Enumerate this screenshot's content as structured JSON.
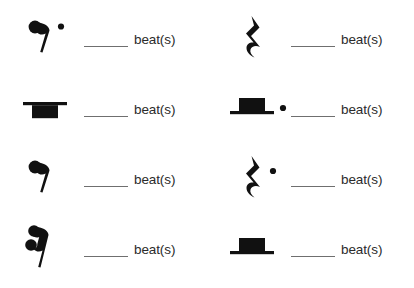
{
  "page": {
    "background_color": "#ffffff",
    "ink_color": "#111111",
    "line_color": "#6f6f6f",
    "text_color": "#2b2b2b",
    "columns": 2,
    "rows": 4
  },
  "labels": {
    "beats": "beat(s)",
    "blank": ""
  },
  "items": [
    {
      "position": "row1-left",
      "icon": "dotted-eighth-rest-icon",
      "symbol_name": "dotted eighth rest",
      "dotted": true,
      "answer_value": "",
      "beats_label": "beat(s)"
    },
    {
      "position": "row1-right",
      "icon": "quarter-rest-icon",
      "symbol_name": "quarter rest",
      "dotted": false,
      "answer_value": "",
      "beats_label": "beat(s)"
    },
    {
      "position": "row2-left",
      "icon": "whole-rest-icon",
      "symbol_name": "whole rest",
      "dotted": false,
      "answer_value": "",
      "beats_label": "beat(s)"
    },
    {
      "position": "row2-right",
      "icon": "dotted-half-rest-icon",
      "symbol_name": "dotted half rest",
      "dotted": true,
      "answer_value": "",
      "beats_label": "beat(s)"
    },
    {
      "position": "row3-left",
      "icon": "eighth-rest-icon",
      "symbol_name": "eighth rest",
      "dotted": false,
      "answer_value": "",
      "beats_label": "beat(s)"
    },
    {
      "position": "row3-right",
      "icon": "dotted-quarter-rest-icon",
      "symbol_name": "dotted quarter rest",
      "dotted": true,
      "answer_value": "",
      "beats_label": "beat(s)"
    },
    {
      "position": "row4-left",
      "icon": "sixteenth-rest-icon",
      "symbol_name": "sixteenth rest",
      "dotted": false,
      "answer_value": "",
      "beats_label": "beat(s)"
    },
    {
      "position": "row4-right",
      "icon": "half-rest-icon",
      "symbol_name": "half rest",
      "dotted": false,
      "answer_value": "",
      "beats_label": "beat(s)"
    }
  ]
}
